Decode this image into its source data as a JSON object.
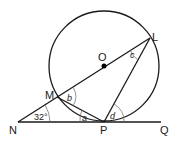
{
  "diagram": {
    "type": "circle-geometry",
    "points": {
      "O": {
        "label": "O",
        "x": 104,
        "y": 66
      },
      "L": {
        "label": "L",
        "x": 150,
        "y": 38
      },
      "M": {
        "label": "M",
        "x": 57,
        "y": 96
      },
      "N": {
        "label": "N",
        "x": 18,
        "y": 122
      },
      "P": {
        "label": "P",
        "x": 104,
        "y": 122
      },
      "Q": {
        "label": "Q",
        "x": 161,
        "y": 122
      }
    },
    "circle": {
      "center": "O",
      "radius": 55
    },
    "segments": [
      "N-L (through M and O)",
      "N-Q (tangent at P)",
      "M-P",
      "P-L"
    ],
    "angles": {
      "given": {
        "at": "N",
        "value": "32°"
      },
      "a": {
        "label": "a",
        "at": "P",
        "between": "NP, PM"
      },
      "b": {
        "label": "b",
        "at": "M",
        "between": "MO, MP"
      },
      "c": {
        "label": "c",
        "at": "L",
        "between": "LO, LP"
      },
      "d": {
        "label": "d",
        "at": "P",
        "between": "PL, PQ"
      }
    },
    "colors": {
      "line": "#1a1a1a",
      "center_dot": "#000000",
      "angle_arc": "#666666"
    }
  }
}
